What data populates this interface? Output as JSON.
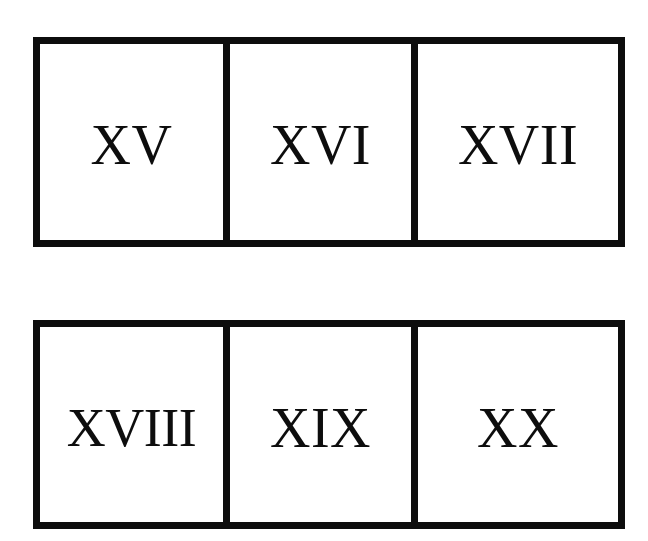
{
  "page": {
    "background_color": "#ffffff",
    "ink_color": "#0d0d0d"
  },
  "rows": [
    {
      "name": "row-top",
      "cells": [
        {
          "numeral": "XV",
          "value": 15
        },
        {
          "numeral": "XVI",
          "value": 16
        },
        {
          "numeral": "XVII",
          "value": 17
        }
      ]
    },
    {
      "name": "row-bottom",
      "cells": [
        {
          "numeral": "XVIII",
          "value": 18
        },
        {
          "numeral": "XIX",
          "value": 19
        },
        {
          "numeral": "XX",
          "value": 20
        }
      ]
    }
  ]
}
